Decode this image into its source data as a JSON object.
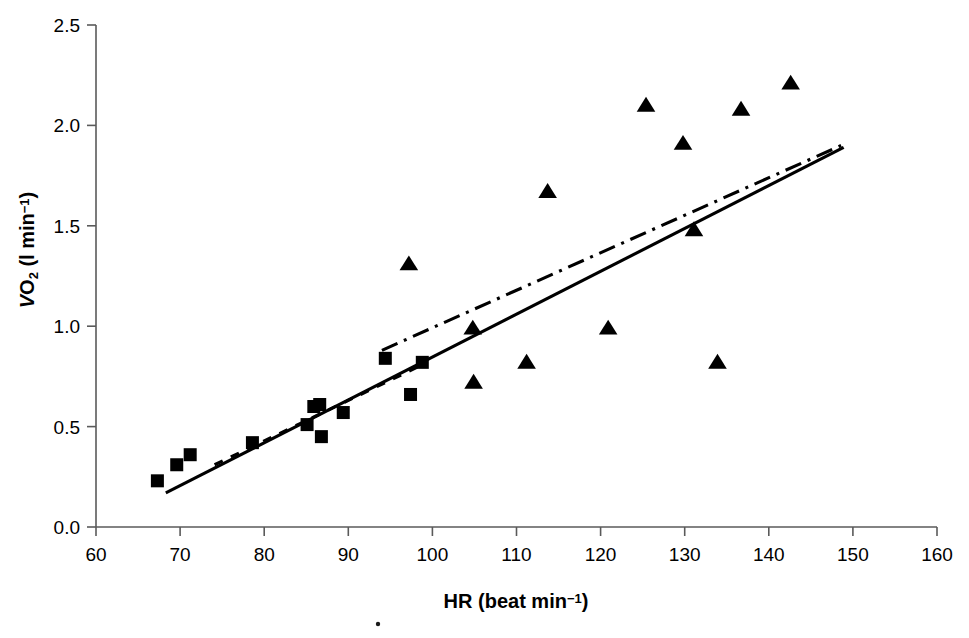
{
  "chart_data": {
    "type": "scatter",
    "title": "",
    "subtitle": "",
    "xlabel": "HR (beat min-1)",
    "xlabel_parts": {
      "main": "HR (beat min",
      "sup": "−1",
      "tail": ")"
    },
    "ylabel": "VO2 (l min-1)",
    "ylabel_parts": {
      "lead": "V",
      "sub": "O",
      "sub2": "2",
      "mid": " (l min",
      "sup": "−1",
      "tail": ")"
    },
    "xlim": [
      60,
      160
    ],
    "ylim": [
      0.0,
      2.5
    ],
    "xticks": [
      60,
      70,
      80,
      90,
      100,
      110,
      120,
      130,
      140,
      150,
      160
    ],
    "xtick_labels": [
      "60",
      "70",
      "80",
      "90",
      "100",
      "110",
      "120",
      "130",
      "140",
      "150",
      "160"
    ],
    "yticks": [
      0.0,
      0.5,
      1.0,
      1.5,
      2.0,
      2.5
    ],
    "ytick_labels": [
      "0.0",
      "0.5",
      "1.0",
      "1.5",
      "2.0",
      "2.5"
    ],
    "grid": false,
    "legend": "none",
    "legend_position": "none",
    "marker_color": "#000000",
    "axis_color": "#5a5a5a",
    "series": [
      {
        "name": "squares",
        "marker": "square",
        "marker_size": 13,
        "points": [
          {
            "x": 67.3,
            "y": 0.23
          },
          {
            "x": 69.6,
            "y": 0.31
          },
          {
            "x": 71.2,
            "y": 0.36
          },
          {
            "x": 78.6,
            "y": 0.42
          },
          {
            "x": 85.1,
            "y": 0.51
          },
          {
            "x": 85.9,
            "y": 0.6
          },
          {
            "x": 86.6,
            "y": 0.61
          },
          {
            "x": 86.8,
            "y": 0.45
          },
          {
            "x": 89.4,
            "y": 0.57
          },
          {
            "x": 94.4,
            "y": 0.84
          },
          {
            "x": 97.4,
            "y": 0.66
          },
          {
            "x": 98.8,
            "y": 0.82
          }
        ]
      },
      {
        "name": "triangles",
        "marker": "triangle",
        "marker_size": 15,
        "points": [
          {
            "x": 97.2,
            "y": 1.31
          },
          {
            "x": 104.8,
            "y": 0.99
          },
          {
            "x": 104.9,
            "y": 0.72
          },
          {
            "x": 111.2,
            "y": 0.82
          },
          {
            "x": 113.7,
            "y": 1.67
          },
          {
            "x": 120.9,
            "y": 0.99
          },
          {
            "x": 125.4,
            "y": 2.1
          },
          {
            "x": 129.8,
            "y": 1.91
          },
          {
            "x": 131.1,
            "y": 1.48
          },
          {
            "x": 133.9,
            "y": 0.82
          },
          {
            "x": 136.7,
            "y": 2.08
          },
          {
            "x": 142.6,
            "y": 2.21
          }
        ]
      }
    ],
    "fit_lines": [
      {
        "name": "solid-regression-line",
        "style": "solid",
        "x0": 68.3,
        "y0": 0.17,
        "x1": 148.9,
        "y1": 1.89
      },
      {
        "name": "dashdot-regression-line",
        "style": "dash-dot",
        "x0": 94.0,
        "y0": 0.88,
        "x1": 148.6,
        "y1": 1.9
      },
      {
        "name": "dotted-regression-line",
        "style": "dotted",
        "x0": 74.1,
        "y0": 0.31,
        "x1": 99.4,
        "y1": 0.82
      }
    ]
  },
  "figure": {
    "background": "#ffffff",
    "width": 969,
    "height": 638
  }
}
